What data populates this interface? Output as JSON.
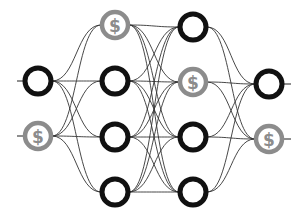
{
  "diagram": {
    "title": "",
    "layers": [
      {
        "name": "input",
        "nodes": [
          {
            "type": "plain"
          },
          {
            "type": "dollar"
          }
        ]
      },
      {
        "name": "hidden-1",
        "nodes": [
          {
            "type": "dollar"
          },
          {
            "type": "plain"
          },
          {
            "type": "plain"
          },
          {
            "type": "plain"
          }
        ]
      },
      {
        "name": "hidden-2",
        "nodes": [
          {
            "type": "plain"
          },
          {
            "type": "dollar"
          },
          {
            "type": "plain"
          },
          {
            "type": "plain"
          }
        ]
      },
      {
        "name": "output",
        "nodes": [
          {
            "type": "plain"
          },
          {
            "type": "dollar"
          }
        ]
      }
    ],
    "connectivity": "fully-connected",
    "dollar_symbol": "$",
    "colors": {
      "plain_node": "#111111",
      "dollar_node": "#8c8c8c",
      "edge": "#333333",
      "background": "#ffffff"
    }
  }
}
